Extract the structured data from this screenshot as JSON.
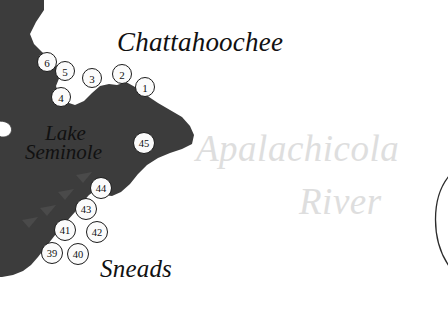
{
  "map": {
    "title": "Lake Seminole / Apalachicola River access-site map",
    "background_color": "#ffffff",
    "land_color": "#3c3c3c",
    "water_color": "#ffffff",
    "marker_fill": "#fbfbfb",
    "marker_stroke": "#1b1b1b",
    "watermark_color": "#dedede"
  },
  "labels": {
    "chattahoochee": "Chattahoochee",
    "sneads": "Sneads",
    "lake_line1": "Lake",
    "lake_line2": "Seminole",
    "river_line1": "Apalachicola",
    "river_line2": "River"
  },
  "markers": [
    {
      "id": "1",
      "label": "1",
      "x": 145,
      "y": 87,
      "r": 10
    },
    {
      "id": "2",
      "label": "2",
      "x": 122,
      "y": 74,
      "r": 10
    },
    {
      "id": "3",
      "label": "3",
      "x": 92,
      "y": 78,
      "r": 10
    },
    {
      "id": "4",
      "label": "4",
      "x": 61,
      "y": 97,
      "r": 10
    },
    {
      "id": "5",
      "label": "5",
      "x": 65,
      "y": 71,
      "r": 10
    },
    {
      "id": "6",
      "label": "6",
      "x": 47,
      "y": 62,
      "r": 10
    },
    {
      "id": "45",
      "label": "45",
      "x": 144,
      "y": 143,
      "r": 11
    },
    {
      "id": "44",
      "label": "44",
      "x": 101,
      "y": 188,
      "r": 11
    },
    {
      "id": "43",
      "label": "43",
      "x": 86,
      "y": 209,
      "r": 11
    },
    {
      "id": "42",
      "label": "42",
      "x": 97,
      "y": 232,
      "r": 11
    },
    {
      "id": "41",
      "label": "41",
      "x": 65,
      "y": 230,
      "r": 11
    },
    {
      "id": "40",
      "label": "40",
      "x": 78,
      "y": 254,
      "r": 11
    },
    {
      "id": "39",
      "label": "39",
      "x": 52,
      "y": 253,
      "r": 11
    }
  ],
  "geometry": {
    "land_main": "M 0,0 L 40,0 L 40,12 L 34,24 L 40,37 L 46,48 L 52,56 L 58,64 L 60,74 L 56,84 L 58,92 L 64,100 L 72,106 L 80,104 L 88,98 L 96,88 L 104,84 L 112,86 L 120,84 L 128,82 L 136,88 L 146,96 L 158,104 L 170,110 L 182,116 L 190,124 L 196,132 L 196,142 L 188,148 L 176,152 L 164,156 L 152,162 L 142,170 L 134,180 L 126,190 L 118,196 L 110,198 L 102,196 L 96,192 L 90,196 L 84,202 L 78,210 L 70,218 L 62,226 L 56,234 L 50,242 L 44,250 L 38,258 L 32,266 L 26,272 L 18,276 L 8,278 L 0,278 Z",
    "river_channel": "M 78,272 C 70,276 58,282 48,290 C 40,296 34,304 28,312 C 24,318 20,322 14,326 L 34,326 C 42,318 52,308 62,300 C 70,294 80,288 90,284 Z",
    "island_small": "M 0,122 C 4,120 9,121 11,125 C 13,129 11,134 6,136 C 2,137 0,136 0,134 Z",
    "shore_ticks": [
      "M 46,190 L 60,186 L 52,196 Z",
      "M 62,208 L 76,204 L 68,214 Z",
      "M 78,190 L 92,186 L 84,196 Z",
      "M 22,216 L 36,212 L 28,222 Z"
    ],
    "river_arc": "M 447,178 C 430,200 430,238 447,264"
  }
}
